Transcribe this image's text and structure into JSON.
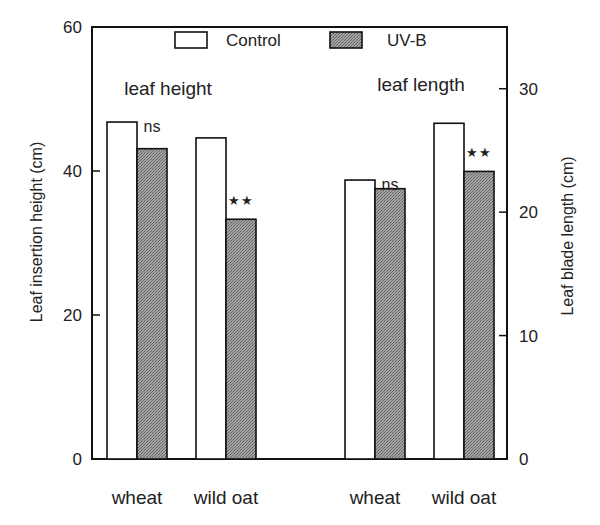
{
  "chart_data": {
    "type": "bar",
    "title": "",
    "panels": [
      {
        "label": "leaf height",
        "axis": "left",
        "ylabel": "Leaf insertion height (cm)",
        "ylim": [
          0,
          60
        ],
        "yticks": [
          0,
          20,
          40,
          60
        ],
        "categories": [
          "wheat",
          "wild oat"
        ],
        "series": [
          {
            "name": "Control",
            "values": [
              46.8,
              44.6
            ]
          },
          {
            "name": "UV-B",
            "values": [
              43.1,
              33.3
            ]
          }
        ],
        "significance": [
          "ns",
          "**"
        ]
      },
      {
        "label": "leaf length",
        "axis": "right",
        "ylabel": "Leaf blade length (cm)",
        "ylim": [
          0,
          35
        ],
        "yticks": [
          0,
          10,
          20,
          30
        ],
        "categories": [
          "wheat",
          "wild oat"
        ],
        "series": [
          {
            "name": "Control",
            "values": [
              22.6,
              27.2
            ]
          },
          {
            "name": "UV-B",
            "values": [
              21.9,
              23.3
            ]
          }
        ],
        "significance": [
          "ns",
          "**"
        ]
      }
    ],
    "legend": {
      "position": "top-center",
      "entries": [
        {
          "name": "Control",
          "fill": "#ffffff"
        },
        {
          "name": "UV-B",
          "fill": "#8f8f8f"
        }
      ]
    },
    "grid": false
  },
  "layout": {
    "plot": {
      "left": 92,
      "right": 507,
      "top": 27,
      "bottom": 459
    },
    "bar_positions": [
      {
        "panel": 0,
        "cat": 0,
        "series": 0,
        "x": 107
      },
      {
        "panel": 0,
        "cat": 0,
        "series": 1,
        "x": 137
      },
      {
        "panel": 0,
        "cat": 1,
        "series": 0,
        "x": 196
      },
      {
        "panel": 0,
        "cat": 1,
        "series": 1,
        "x": 226
      },
      {
        "panel": 1,
        "cat": 0,
        "series": 0,
        "x": 345
      },
      {
        "panel": 1,
        "cat": 0,
        "series": 1,
        "x": 375
      },
      {
        "panel": 1,
        "cat": 1,
        "series": 0,
        "x": 434
      },
      {
        "panel": 1,
        "cat": 1,
        "series": 1,
        "x": 464
      }
    ],
    "bar_width": 30
  }
}
